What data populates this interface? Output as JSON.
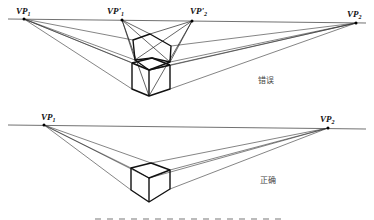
{
  "figure": {
    "panels": [
      {
        "id": "wrong",
        "label": "错误",
        "vanishing_points": [
          {
            "name": "VP",
            "sub": "1",
            "prime": false,
            "x": 24,
            "y": 19
          },
          {
            "name": "VP'",
            "sub": "1",
            "prime": true,
            "x": 122,
            "y": 20
          },
          {
            "name": "VP'",
            "sub": "2",
            "prime": true,
            "x": 192,
            "y": 21
          },
          {
            "name": "VP",
            "sub": "2",
            "prime": false,
            "x": 356,
            "y": 23
          }
        ]
      },
      {
        "id": "right",
        "label": "正确",
        "vanishing_points": [
          {
            "name": "VP",
            "sub": "1",
            "prime": false,
            "x": 44,
            "y": 125
          },
          {
            "name": "VP",
            "sub": "2",
            "prime": false,
            "x": 328,
            "y": 128
          }
        ]
      }
    ],
    "caption_visible": "clipped"
  },
  "colors": {
    "line": "#2a2a2a",
    "cube": "#111111",
    "label_cn": "#444444"
  }
}
